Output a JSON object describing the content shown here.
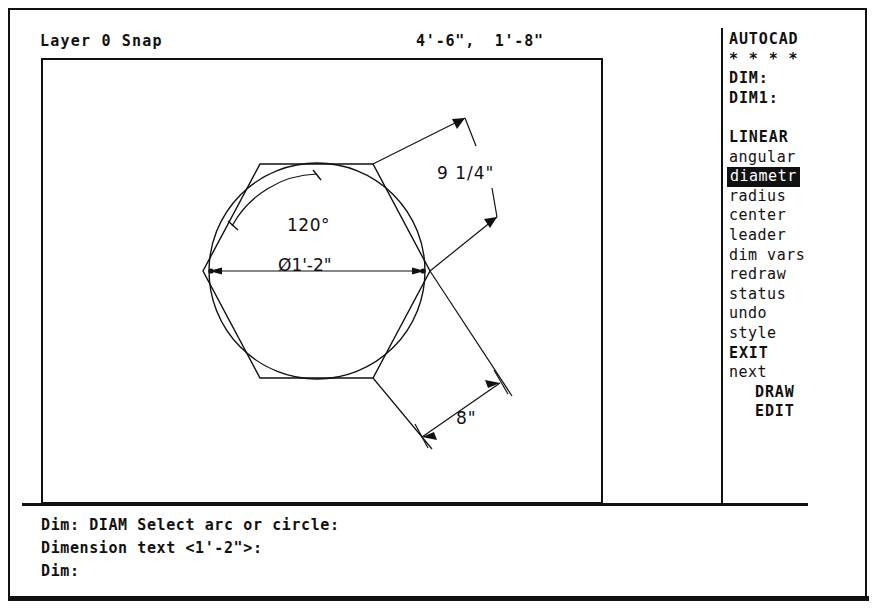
{
  "status_bar": {
    "layer_text": "Layer 0 Snap",
    "coordinates": "4'-6\",  1'-8\""
  },
  "side_menu": {
    "title": "AUTOCAD",
    "stars": "* * * *",
    "dim_label": "DIM:",
    "dim1_label": "DIM1:",
    "items": [
      {
        "label": "LINEAR",
        "style": "bold",
        "selected": false
      },
      {
        "label": "angular",
        "style": "normal",
        "selected": false
      },
      {
        "label": "diametr",
        "style": "normal",
        "selected": true
      },
      {
        "label": "radius",
        "style": "normal",
        "selected": false
      },
      {
        "label": "center",
        "style": "normal",
        "selected": false
      },
      {
        "label": "leader",
        "style": "normal",
        "selected": false
      },
      {
        "label": "dim vars",
        "style": "normal",
        "selected": false
      },
      {
        "label": "redraw",
        "style": "normal",
        "selected": false
      },
      {
        "label": "status",
        "style": "normal",
        "selected": false
      },
      {
        "label": "undo",
        "style": "normal",
        "selected": false
      },
      {
        "label": "style",
        "style": "normal",
        "selected": false
      },
      {
        "label": "EXIT",
        "style": "bold",
        "selected": false
      },
      {
        "label": "next",
        "style": "normal",
        "selected": false
      },
      {
        "label": "DRAW",
        "style": "bold",
        "selected": false,
        "indent": true
      },
      {
        "label": "EDIT",
        "style": "bold",
        "selected": false,
        "indent": true
      }
    ]
  },
  "command_area": {
    "lines": [
      "Dim: DIAM Select arc or circle:",
      "Dimension text <1'-2\">:",
      "Dim:"
    ]
  },
  "drawing": {
    "angular_dimension": "120°",
    "diameter_dimension": "Ø1'-2\"",
    "linear_dimension_right": "9 1/4\"",
    "linear_dimension_bottom": "8\"",
    "shapes": {
      "hexagon": "inscribed-hexagon",
      "circle": "inscribed-circle"
    }
  },
  "colors": {
    "ink": "#111111",
    "background": "#ffffff",
    "highlight_bg": "#111111",
    "highlight_fg": "#ffffff"
  }
}
